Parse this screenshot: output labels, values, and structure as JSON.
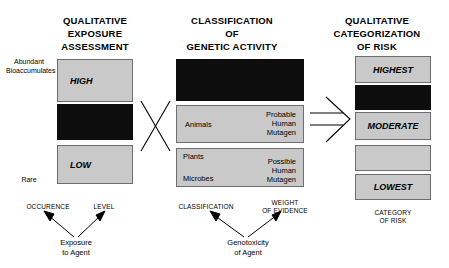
{
  "headers": {
    "exposure": [
      "QUALITATIVE",
      "EXPOSURE",
      "ASSESSMENT"
    ],
    "classification": [
      "CLASSIFICATION",
      "OF",
      "GENETIC ACTIVITY"
    ],
    "risk": [
      "QUALITATIVE",
      "CATEGORIZATION",
      "OF RISK"
    ]
  },
  "exposure_column": {
    "top_scale_label": "Abundant\nBioaccumulates",
    "bottom_scale_label": "Rare",
    "boxes": [
      {
        "label": "HIGH",
        "shade": "gray"
      },
      {
        "label": "",
        "shade": "black"
      },
      {
        "label": "LOW",
        "shade": "gray"
      }
    ]
  },
  "classification_column": {
    "boxes": [
      {
        "shade": "black",
        "left_text": "",
        "right_text": ""
      },
      {
        "shade": "gray",
        "left_text": "Animals",
        "right_text": "Probable\nHuman\nMutagen"
      },
      {
        "shade": "gray",
        "left_text_top": "Plants",
        "left_text_bottom": "Microbes",
        "right_text": "Possible\nHuman\nMutagen"
      }
    ]
  },
  "risk_column": {
    "boxes": [
      {
        "label": "HIGHEST",
        "shade": "gray"
      },
      {
        "label": "",
        "shade": "black"
      },
      {
        "label": "MODERATE",
        "shade": "gray"
      },
      {
        "label": "",
        "shade": "gray"
      },
      {
        "label": "LOWEST",
        "shade": "gray"
      }
    ]
  },
  "captions": {
    "occurrence": "OCCURENCE",
    "level": "LEVEL",
    "exposure_source": "Exposure\nto Agent",
    "classification": "CLASSIFICATION",
    "weight_of_evidence": "WEIGHT\nOF EVIDENCE",
    "genotoxicity_source": "Genotoxicity\nof Agent",
    "category_of_risk": "CATEGORY\nOF RISK"
  },
  "colors": {
    "gray_fill": "#c9c9c9",
    "black_fill": "#0d0d0d",
    "border": "#6e6e6e",
    "text": "#000000",
    "background": "#ffffff"
  }
}
